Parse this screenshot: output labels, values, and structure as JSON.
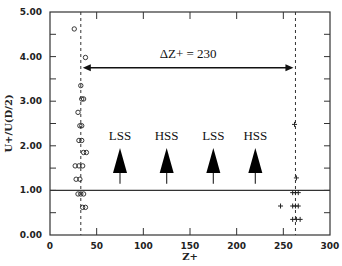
{
  "chart_data": {
    "type": "scatter",
    "title": "",
    "xlabel": "Z+",
    "ylabel": "U+/U(D/2)",
    "xlim": [
      0,
      300
    ],
    "ylim": [
      0,
      5
    ],
    "xticks": [
      0,
      50,
      100,
      150,
      200,
      250,
      300
    ],
    "xtick_labels": [
      "0",
      "50",
      "100",
      "150",
      "200",
      "250",
      "300"
    ],
    "yticks": [
      0,
      1,
      2,
      3,
      4,
      5
    ],
    "ytick_labels": [
      "0.00",
      "1.00",
      "2.00",
      "3.00",
      "4.00",
      "5.00"
    ],
    "grid": false,
    "reference_lines": {
      "horizontal_y": 1.0,
      "vertical_dashed_x": [
        33,
        263
      ]
    },
    "series": [
      {
        "name": "circles",
        "marker": "o",
        "points": [
          [
            26,
            4.62
          ],
          [
            38,
            3.98
          ],
          [
            33,
            3.35
          ],
          [
            34,
            3.05
          ],
          [
            36,
            3.05
          ],
          [
            30,
            2.75
          ],
          [
            32,
            2.45
          ],
          [
            34,
            2.45
          ],
          [
            31,
            2.12
          ],
          [
            34,
            2.12
          ],
          [
            36,
            1.85
          ],
          [
            39,
            1.85
          ],
          [
            27,
            1.55
          ],
          [
            31,
            1.55
          ],
          [
            35,
            1.55
          ],
          [
            28,
            1.25
          ],
          [
            32,
            1.25
          ],
          [
            30,
            0.92
          ],
          [
            33,
            0.92
          ],
          [
            36,
            0.92
          ],
          [
            35,
            0.62
          ],
          [
            38,
            0.62
          ]
        ]
      },
      {
        "name": "crosses",
        "marker": "+",
        "points": [
          [
            262,
            2.48
          ],
          [
            264,
            1.28
          ],
          [
            260,
            0.95
          ],
          [
            263,
            0.95
          ],
          [
            266,
            0.95
          ],
          [
            247,
            0.65
          ],
          [
            260,
            0.65
          ],
          [
            263,
            0.65
          ],
          [
            266,
            0.65
          ],
          [
            260,
            0.35
          ],
          [
            264,
            0.35
          ],
          [
            268,
            0.35
          ]
        ]
      }
    ],
    "annotations": {
      "delta_label": "ΔZ+ = 230",
      "delta_arrow": {
        "x_from": 33,
        "x_to": 263,
        "y": 3.75
      },
      "regions": [
        {
          "label": "LSS",
          "x": 75
        },
        {
          "label": "HSS",
          "x": 125
        },
        {
          "label": "LSS",
          "x": 175
        },
        {
          "label": "HSS",
          "x": 220
        }
      ],
      "region_arrow_y_range": [
        1.15,
        1.95
      ]
    }
  }
}
